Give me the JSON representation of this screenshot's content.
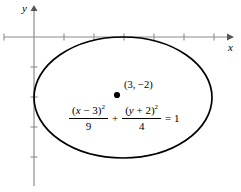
{
  "figure": {
    "kind": "coordinate-plane-conic-graph",
    "background_color": "#ffffff",
    "axis_color": "#8c8c8c",
    "curve_color": "#000000",
    "text_color": "#000000"
  },
  "axes": {
    "x_label": "x",
    "y_label": "y",
    "x_axis_y_px": 37,
    "y_axis_x_px": 34,
    "tick_spacing_px": 30,
    "x_ticks_px": [
      4,
      64,
      94,
      124,
      154,
      184,
      214
    ],
    "y_ticks_px": [
      67,
      97,
      127,
      157
    ],
    "x_arrow": true,
    "y_arrow": true
  },
  "conic": {
    "type": "ellipse",
    "center_label": "(3, −2)",
    "center_point_px": {
      "x": 117,
      "y": 95
    },
    "center": {
      "h": 3,
      "k": -2
    },
    "semi_axis_a": 3,
    "semi_axis_b": 2,
    "bbox_px": {
      "left": 34,
      "top": 37,
      "right": 212,
      "bottom": 158
    }
  },
  "equation": {
    "numerator_1": "(x − 3)",
    "numerator_1_exp": "2",
    "denominator_1": "9",
    "plus": "+",
    "numerator_2": "(y + 2)",
    "numerator_2_exp": "2",
    "denominator_2": "4",
    "equals": "= 1",
    "full_text": "(x − 3)²/9 + (y + 2)²/4 = 1"
  }
}
